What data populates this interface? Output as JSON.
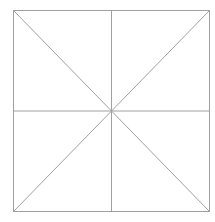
{
  "diagram": {
    "shape": "square divided into 8 triangles",
    "stroke_color": "#a0a0a0",
    "background": "#ffffff",
    "square": {
      "x": 13,
      "y": 10,
      "width": 196,
      "height": 201
    },
    "lines": [
      "vertical-midline",
      "horizontal-midline",
      "diagonal-top-left-to-bottom-right",
      "diagonal-top-right-to-bottom-left"
    ]
  }
}
